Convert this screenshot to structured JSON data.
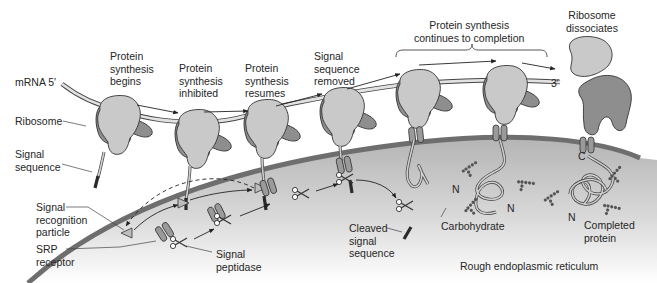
{
  "figure": {
    "colors": {
      "ribosome_small": "#c8c8c8",
      "ribosome_large": "#8e8e8e",
      "membrane": "#6e6e6e",
      "er_lumen_top": "#b9b9b9",
      "er_lumen_bottom": "#ffffff",
      "signal_sequence": "#2a2a2a",
      "mrna": "#e2e2e2"
    }
  },
  "labels": {
    "mrna_5": "mRNA 5′",
    "mrna_3": "3′",
    "ribosome": "Ribosome",
    "signal_sequence": "Signal\nsequence",
    "srp": "Signal\nrecognition\nparticle",
    "srp_receptor": "SRP\nreceptor",
    "signal_peptidase": "Signal\npeptidase",
    "cleaved_signal_sequence": "Cleaved\nsignal\nsequence",
    "carbohydrate": "Carbohydrate",
    "completed_protein": "Completed\nprotein",
    "rough_er": "Rough endoplasmic reticulum",
    "n_terminus": "N",
    "c_terminus": "C"
  },
  "steps": [
    {
      "label": "Protein\nsynthesis\nbegins"
    },
    {
      "label": "Protein\nsynthesis\ninhibited"
    },
    {
      "label": "Protein\nsynthesis\nresumes"
    },
    {
      "label": "Signal\nsequence\nremoved"
    },
    {
      "label": "Protein synthesis\ncontinues to completion"
    },
    {
      "label": "Ribosome\ndissociates"
    }
  ]
}
